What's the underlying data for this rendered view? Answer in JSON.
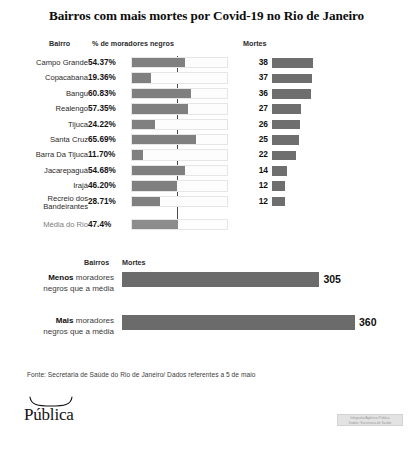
{
  "title": "Bairros com mais mortes por Covid-19 no Rio de Janeiro",
  "headers": {
    "bairro": "Bairro",
    "percent": "% de moradores negros",
    "mortes": "Mortes"
  },
  "bottom_headers": {
    "bairros": "Bairros",
    "mortes": "Mortes"
  },
  "source": "Fonte: Secretaria de Saúde do Rio de Janeiro/ Dados referentes a 5 de maio",
  "logo": {
    "text": "Pública"
  },
  "watermark": {
    "line1": "Infografia/Agência Pública",
    "line2": "Dados: Secretaria de Saúde"
  },
  "colors": {
    "bar_fill": "#808080",
    "deaths_bar": "#6e6e6e",
    "summary_bar": "#6b6b6b",
    "track_bg": "#fdfdfd",
    "avg_line": "#4a4a4a"
  },
  "chart_data": {
    "type": "bar",
    "title": "Bairros com mais mortes por Covid-19 no Rio de Janeiro",
    "xlabel": "",
    "ylabel": "",
    "grid": false,
    "legend": "none",
    "categories": [
      "Campo Grande",
      "Copacabana",
      "Bangu",
      "Realengo",
      "Tijuca",
      "Santa Cruz",
      "Barra Da Tijuca",
      "Jacarepaguá",
      "Irajá",
      "Recreio dos Bandeirantes"
    ],
    "series": [
      {
        "name": "% de moradores negros",
        "unit": "%",
        "values": [
          54.37,
          19.36,
          60.83,
          57.35,
          24.22,
          65.69,
          11.7,
          54.68,
          46.2,
          28.71
        ],
        "labels": [
          "54.37%",
          "19.36%",
          "60.83%",
          "57.35%",
          "24.22%",
          "65.69%",
          "11.70%",
          "54.68%",
          "46.20%",
          "28.71%"
        ],
        "xlim": [
          0,
          100
        ]
      },
      {
        "name": "Mortes",
        "unit": "mortes",
        "values": [
          38,
          37,
          36,
          27,
          26,
          25,
          22,
          14,
          12,
          12
        ],
        "labels": [
          "38",
          "37",
          "36",
          "27",
          "26",
          "25",
          "22",
          "14",
          "12",
          "12"
        ],
        "xlim": [
          0,
          38
        ]
      }
    ],
    "reference": {
      "label": "Média do Rio",
      "value": 47.4,
      "value_label": "47.4%",
      "line": true
    },
    "summary": {
      "type": "bar",
      "xlabel": "Mortes",
      "categories": [
        {
          "strong": "Menos",
          "rest": "moradores",
          "line2": "negros que a média"
        },
        {
          "strong": "Mais",
          "rest": "moradores",
          "line2": "negros que a média"
        }
      ],
      "values": [
        305,
        360
      ],
      "labels": [
        "305",
        "360"
      ],
      "xlim": [
        0,
        360
      ]
    }
  }
}
